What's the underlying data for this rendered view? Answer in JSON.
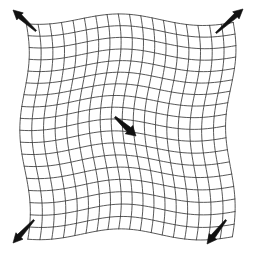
{
  "figure": {
    "background_color": "#ffffff",
    "grid_line_color": "#3a3a3a",
    "arrow_color": "#111111",
    "width": 255,
    "height": 255
  },
  "grid": {
    "columns": 18,
    "rows": 18,
    "line_width": 0.85,
    "bounds": {
      "left": 23,
      "top": 18,
      "right": 232,
      "bottom": 234
    },
    "distortion": {
      "type": "sinusoidal-wave",
      "x_amplitude": 5.0,
      "y_amplitude": 5.5,
      "x_frequency": 1.35,
      "y_frequency": 1.25,
      "x_phase": 0.45,
      "y_phase": 1.15,
      "cross_amplitude": 3.2
    }
  },
  "arrows": [
    {
      "name": "top-left-corner-vector",
      "label": "top-left",
      "x1": 36,
      "y1": 31,
      "x2": 13,
      "y2": 10,
      "head_at": "end",
      "direction": "up-left",
      "thickness": 2.4
    },
    {
      "name": "top-right-corner-vector",
      "label": "top-right",
      "x1": 216,
      "y1": 33,
      "x2": 243,
      "y2": 9,
      "head_at": "end",
      "direction": "up-right",
      "thickness": 2.4
    },
    {
      "name": "bottom-left-corner-vector",
      "label": "bottom-left",
      "x1": 34,
      "y1": 220,
      "x2": 13,
      "y2": 243,
      "head_at": "end",
      "direction": "down-left",
      "thickness": 2.4
    },
    {
      "name": "bottom-right-corner-vector",
      "label": "bottom-right",
      "x1": 226,
      "y1": 220,
      "x2": 207,
      "y2": 244,
      "head_at": "end",
      "direction": "down-left",
      "thickness": 2.4
    },
    {
      "name": "center-vector",
      "label": "center",
      "x1": 115,
      "y1": 117,
      "x2": 136,
      "y2": 136,
      "head_at": "end",
      "direction": "down-right",
      "thickness": 2.8
    }
  ]
}
